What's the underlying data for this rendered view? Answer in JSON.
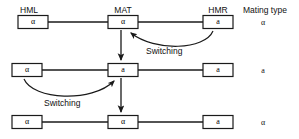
{
  "figure": {
    "locus_labels": [
      {
        "name": "HML",
        "text": "HML",
        "x": 14,
        "y": 6
      },
      {
        "name": "MAT",
        "text": "MAT",
        "x": 107,
        "y": 6
      },
      {
        "name": "HMR",
        "text": "HMR",
        "x": 200,
        "y": 6
      }
    ],
    "mating_type_header": {
      "text": "Mating type",
      "x": 243,
      "y": 6
    },
    "rows": [
      {
        "name": "row-1",
        "y": 22,
        "boxes": [
          {
            "locus": "HML",
            "allele": "α",
            "x": 18,
            "w": 30
          },
          {
            "locus": "MAT",
            "allele": "α",
            "x": 108,
            "w": 30
          },
          {
            "locus": "HMR",
            "allele": "a",
            "x": 203,
            "w": 30
          }
        ],
        "mating_type": "α"
      },
      {
        "name": "row-2",
        "y": 70,
        "boxes": [
          {
            "locus": "HML",
            "allele": "α",
            "x": 12,
            "w": 30
          },
          {
            "locus": "MAT",
            "allele": "a",
            "x": 108,
            "w": 30
          },
          {
            "locus": "HMR",
            "allele": "a",
            "x": 203,
            "w": 30
          }
        ],
        "mating_type": "a"
      },
      {
        "name": "row-3",
        "y": 122,
        "boxes": [
          {
            "locus": "HML",
            "allele": "α",
            "x": 12,
            "w": 30
          },
          {
            "locus": "MAT",
            "allele": "α",
            "x": 108,
            "w": 30
          },
          {
            "locus": "HMR",
            "allele": "a",
            "x": 203,
            "w": 30
          }
        ],
        "mating_type": "α"
      }
    ],
    "switching_labels": [
      {
        "name": "switching-label-1",
        "text": "Switching",
        "x": 146,
        "y": 46
      },
      {
        "name": "switching-label-2",
        "text": "Switching",
        "x": 44,
        "y": 98
      }
    ],
    "colors": {
      "line": "#1a1a1a",
      "box_fill": "#ffffff",
      "text": "#111111",
      "background": "#ffffff"
    }
  }
}
